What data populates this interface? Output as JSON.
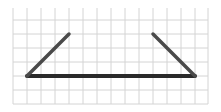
{
  "diagram": {
    "type": "grid-figure",
    "grid": {
      "x_lines": [
        13,
        27,
        41,
        55,
        69,
        83,
        97,
        111,
        125,
        139,
        153,
        167,
        181,
        195,
        208
      ],
      "y_lines": [
        20,
        34,
        48,
        62,
        76,
        90,
        104
      ],
      "top": 8,
      "bottom": 104,
      "left": 13,
      "right": 208,
      "color": "#d4d4d4"
    },
    "segments": [
      {
        "name": "base-line",
        "x1": 27,
        "y1": 76,
        "x2": 195,
        "y2": 76,
        "color": "#2a2a2a",
        "width": 4
      },
      {
        "name": "left-slant-line",
        "x1": 27,
        "y1": 76,
        "x2": 69,
        "y2": 34,
        "color": "#4a4a4a",
        "width": 3.5
      },
      {
        "name": "right-slant-line",
        "x1": 153,
        "y1": 34,
        "x2": 195,
        "y2": 76,
        "color": "#4a4a4a",
        "width": 3.5
      }
    ]
  }
}
